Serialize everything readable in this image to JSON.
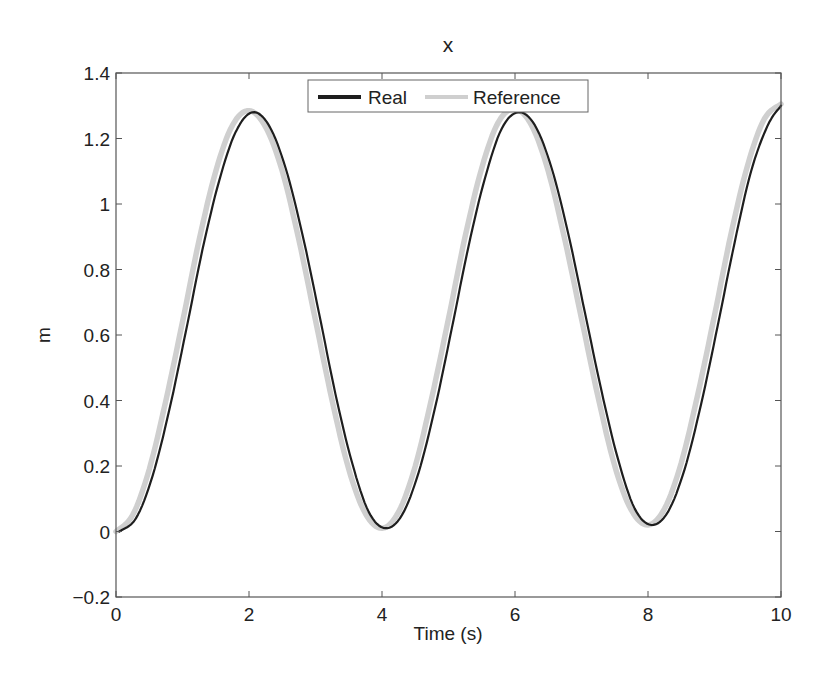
{
  "chart_data": {
    "type": "line",
    "title": "x",
    "xlabel": "Time (s)",
    "ylabel": "m",
    "xlim": [
      0,
      10
    ],
    "ylim": [
      -0.2,
      1.4
    ],
    "xticks": [
      0,
      2,
      4,
      6,
      8,
      10
    ],
    "xtick_labels": [
      "0",
      "2",
      "4",
      "6",
      "8",
      "10"
    ],
    "yticks": [
      -0.2,
      0,
      0.2,
      0.4,
      0.6,
      0.8,
      1,
      1.2,
      1.4
    ],
    "ytick_labels": [
      "−0.2",
      "0",
      "0.2",
      "0.4",
      "0.6",
      "0.8",
      "1",
      "1.2",
      "1.4"
    ],
    "grid": false,
    "legend_position": "top-center",
    "x": [
      0,
      0.25,
      0.5,
      0.75,
      1,
      1.25,
      1.5,
      1.75,
      2,
      2.25,
      2.5,
      2.75,
      3,
      3.25,
      3.5,
      3.75,
      4,
      4.25,
      4.5,
      4.75,
      5,
      5.25,
      5.5,
      5.75,
      6,
      6.25,
      6.5,
      6.75,
      7,
      7.25,
      7.5,
      7.75,
      8,
      8.25,
      8.5,
      8.75,
      9,
      9.25,
      9.5,
      9.75,
      10
    ],
    "series": [
      {
        "name": "Real",
        "color": "#1e1e1e",
        "width": 2.2,
        "values": [
          0.0,
          0.04,
          0.17,
          0.37,
          0.61,
          0.86,
          1.07,
          1.22,
          1.28,
          1.24,
          1.11,
          0.91,
          0.67,
          0.42,
          0.21,
          0.06,
          0.01,
          0.05,
          0.18,
          0.38,
          0.62,
          0.87,
          1.08,
          1.23,
          1.28,
          1.24,
          1.11,
          0.91,
          0.67,
          0.43,
          0.22,
          0.07,
          0.02,
          0.06,
          0.19,
          0.39,
          0.63,
          0.88,
          1.1,
          1.24,
          1.3
        ]
      },
      {
        "name": "Reference",
        "color": "#cfcfcf",
        "width": 5.5,
        "values": [
          0.0,
          0.05,
          0.19,
          0.4,
          0.64,
          0.89,
          1.1,
          1.24,
          1.285,
          1.235,
          1.1,
          0.89,
          0.645,
          0.4,
          0.19,
          0.055,
          0.01,
          0.06,
          0.2,
          0.41,
          0.65,
          0.9,
          1.11,
          1.25,
          1.29,
          1.24,
          1.1,
          0.89,
          0.65,
          0.41,
          0.2,
          0.065,
          0.02,
          0.07,
          0.21,
          0.42,
          0.66,
          0.91,
          1.12,
          1.26,
          1.305
        ]
      }
    ]
  },
  "legend": {
    "items": [
      {
        "label": "Real",
        "color": "#1e1e1e"
      },
      {
        "label": "Reference",
        "color": "#cfcfcf"
      }
    ]
  }
}
